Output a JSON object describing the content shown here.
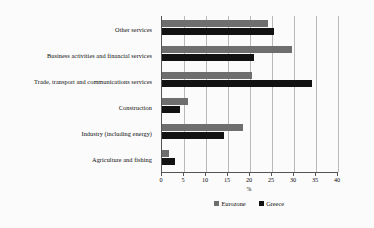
{
  "chart_data": {
    "type": "bar",
    "orientation": "horizontal",
    "title": "",
    "xlabel": "%",
    "ylabel": "",
    "xlim": [
      0,
      40
    ],
    "xticks": [
      0,
      5,
      10,
      15,
      20,
      25,
      30,
      35,
      40
    ],
    "xtick_labels": [
      "0",
      "5",
      "10",
      "15",
      "20",
      "25",
      "30",
      "35",
      "40"
    ],
    "grid": true,
    "legend_position": "bottom-center",
    "categories": [
      "Agriculture and fishing",
      "Industry (including energy)",
      "Construction",
      "Trade, transport and communications services",
      "Business activities and financial services",
      "Other services"
    ],
    "series": [
      {
        "name": "Eurozone",
        "color": "#6e6e6e",
        "values": [
          1.5,
          18.5,
          6.0,
          20.5,
          29.5,
          24.0
        ]
      },
      {
        "name": "Greece",
        "color": "#121212",
        "values": [
          3.0,
          14.0,
          4.0,
          34.0,
          21.0,
          25.5
        ]
      }
    ]
  },
  "legend": {
    "items": [
      {
        "label": "Eurozone"
      },
      {
        "label": "Greece"
      }
    ]
  },
  "colors": {
    "eurozone": "#6e6e6e",
    "greece": "#121212",
    "axis": "#555555",
    "gridline": "#b9b9b9",
    "background": "#fbfbfb"
  }
}
